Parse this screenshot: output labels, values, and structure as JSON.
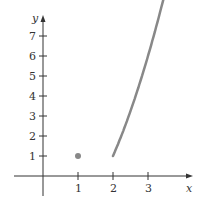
{
  "chart_data": {
    "type": "line",
    "title": "",
    "xlabel": "x",
    "ylabel": "y",
    "xlim": [
      -1.2,
      4.2
    ],
    "ylim": [
      -1.2,
      8.2
    ],
    "x_ticks": [
      "1",
      "2",
      "3"
    ],
    "y_ticks": [
      "1",
      "2",
      "3",
      "4",
      "5",
      "6",
      "7"
    ],
    "grid": false,
    "series": [
      {
        "name": "curve",
        "kind": "line",
        "function": "y = x^2 - 3",
        "domain": [
          2,
          3.45
        ],
        "x": [
          2,
          2.5,
          3,
          3.45
        ],
        "y": [
          1,
          3.25,
          6,
          8.9
        ],
        "color": "#888888"
      },
      {
        "name": "point",
        "kind": "scatter",
        "x": [
          1
        ],
        "y": [
          1
        ],
        "color": "#888888"
      }
    ]
  }
}
